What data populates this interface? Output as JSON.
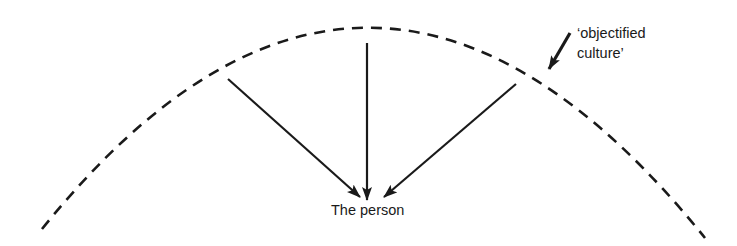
{
  "diagram": {
    "center_label": "The person",
    "arc_label_line1": "‘objectified",
    "arc_label_line2": "culture’",
    "arc_style": "dashed",
    "arrow_count": 3,
    "stroke_color": "#1a1a1a"
  }
}
